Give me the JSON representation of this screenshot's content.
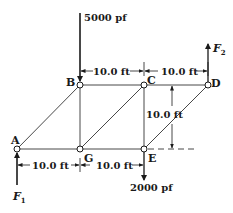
{
  "diagram": {
    "type": "plane truss",
    "nodes": [
      {
        "id": "A",
        "label": "A",
        "x": 17,
        "y": 149
      },
      {
        "id": "B",
        "label": "B",
        "x": 80,
        "y": 85
      },
      {
        "id": "C",
        "label": "C",
        "x": 144,
        "y": 85
      },
      {
        "id": "D",
        "label": "D",
        "x": 208,
        "y": 85
      },
      {
        "id": "G",
        "label": "G",
        "x": 80,
        "y": 149
      },
      {
        "id": "E",
        "label": "E",
        "x": 144,
        "y": 149
      }
    ],
    "members": [
      [
        "A",
        "B"
      ],
      [
        "A",
        "G"
      ],
      [
        "B",
        "C"
      ],
      [
        "C",
        "D"
      ],
      [
        "B",
        "G"
      ],
      [
        "G",
        "C"
      ],
      [
        "G",
        "E"
      ],
      [
        "C",
        "E"
      ],
      [
        "E",
        "D"
      ]
    ],
    "dimensions": {
      "top_left": "10.0 ft",
      "top_right": "10.0 ft",
      "height": "10.0 ft",
      "bottom_left": "10.0 ft",
      "bottom_right": "10.0 ft"
    },
    "loads": {
      "at_B": {
        "label": "5000 pf",
        "direction": "down"
      },
      "at_E": {
        "label": "2000 pf",
        "direction": "down"
      }
    },
    "reactions": {
      "at_A": {
        "label": "F",
        "subscript": "1",
        "direction": "up"
      },
      "at_D": {
        "label": "F",
        "subscript": "2",
        "direction": "up"
      }
    },
    "colors": {
      "line": "#1a1a1a",
      "member": "#333333",
      "background": "#ffffff"
    }
  }
}
